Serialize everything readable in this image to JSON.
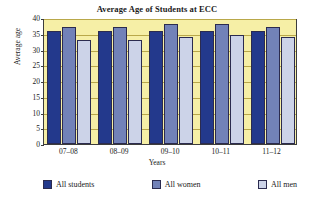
{
  "chart_data": {
    "type": "bar",
    "title": "Average Age of Students at ECC",
    "xlabel": "Years",
    "ylabel": "Average age",
    "categories": [
      "07–08",
      "08–09",
      "09–10",
      "10–11",
      "11–12"
    ],
    "series": [
      {
        "name": "All students",
        "color": "#23398c",
        "values": [
          36,
          36,
          36,
          36,
          36
        ]
      },
      {
        "name": "All women",
        "color": "#7282b8",
        "values": [
          37,
          37,
          38,
          38,
          37
        ]
      },
      {
        "name": "All men",
        "color": "#ccd3e8",
        "values": [
          33,
          33,
          34,
          34.5,
          34
        ]
      }
    ],
    "ylim": [
      0,
      40
    ],
    "yticks": [
      0,
      5,
      10,
      15,
      20,
      25,
      30,
      35,
      40
    ],
    "ytick_labels": [
      "0",
      "5",
      "10",
      "15",
      "20",
      "25",
      "30",
      "35",
      "40"
    ],
    "grid": true,
    "grid_axis": "y",
    "legend_position": "bottom",
    "plot_background": "#f6efa6",
    "page_background": "#ffffff"
  }
}
